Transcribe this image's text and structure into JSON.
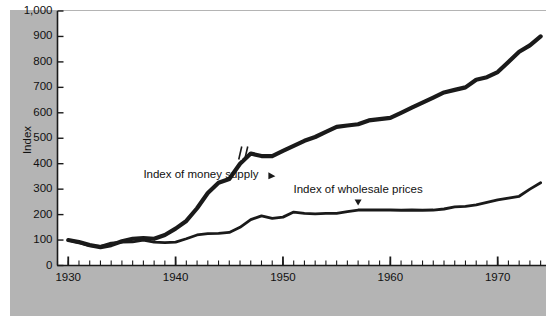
{
  "figure": {
    "background_color": "#ffffff",
    "panel_color": "#b4b4b4",
    "plot_color": "#ffffff",
    "line_color": "#1a1a1a"
  },
  "chart_data": {
    "type": "line",
    "title": "",
    "subtitle": "",
    "xlabel": "",
    "ylabel": "Index",
    "xlim": [
      1929,
      1974.5
    ],
    "ylim": [
      0,
      1000
    ],
    "grid": false,
    "legend_position": "inline-annotation",
    "y_ticks": [
      0,
      100,
      200,
      300,
      400,
      500,
      600,
      700,
      800,
      900,
      1000
    ],
    "y_tick_labels": [
      "0",
      "100",
      "200",
      "300",
      "400",
      "500",
      "600",
      "700",
      "800",
      "900",
      "1,000"
    ],
    "x_ticks": [
      1930,
      1940,
      1950,
      1960,
      1970
    ],
    "x_tick_labels": [
      "1930",
      "1940",
      "1950",
      "1960",
      "1970"
    ],
    "x_minor_tick_interval": 1,
    "annotations": [
      {
        "name": "money-supply-label",
        "text": "Index of money supply",
        "x": 1937.0,
        "y": 355,
        "pointer": "right"
      },
      {
        "name": "wholesale-prices-label",
        "text": "Index of wholesale prices",
        "x": 1957.0,
        "y": 295,
        "pointer": "down"
      },
      {
        "name": "series-break-mark",
        "text": "",
        "x": 1946.3,
        "y": 440,
        "pointer": "break"
      }
    ],
    "series": [
      {
        "name": "Index of money supply",
        "line_width": 4.2,
        "x": [
          1930,
          1931,
          1932,
          1933,
          1934,
          1935,
          1936,
          1937,
          1938,
          1939,
          1940,
          1941,
          1942,
          1943,
          1944,
          1945,
          1946,
          1947,
          1948,
          1949,
          1950,
          1951,
          1952,
          1953,
          1954,
          1955,
          1956,
          1957,
          1958,
          1959,
          1960,
          1961,
          1962,
          1963,
          1964,
          1965,
          1966,
          1967,
          1968,
          1969,
          1970,
          1971,
          1972,
          1973,
          1974
        ],
        "values": [
          100,
          92,
          80,
          72,
          80,
          95,
          105,
          108,
          105,
          120,
          145,
          175,
          225,
          285,
          325,
          340,
          400,
          440,
          430,
          430,
          450,
          470,
          490,
          505,
          525,
          545,
          550,
          555,
          570,
          575,
          580,
          600,
          620,
          640,
          660,
          680,
          690,
          700,
          730,
          740,
          760,
          800,
          840,
          865,
          900
        ]
      },
      {
        "name": "Index of wholesale prices",
        "line_width": 2.8,
        "x": [
          1930,
          1931,
          1932,
          1933,
          1934,
          1935,
          1936,
          1937,
          1938,
          1939,
          1940,
          1941,
          1942,
          1943,
          1944,
          1945,
          1946,
          1947,
          1948,
          1949,
          1950,
          1951,
          1952,
          1953,
          1954,
          1955,
          1956,
          1957,
          1958,
          1959,
          1960,
          1961,
          1962,
          1963,
          1964,
          1965,
          1966,
          1967,
          1968,
          1969,
          1970,
          1971,
          1972,
          1973,
          1974
        ],
        "values": [
          100,
          90,
          78,
          75,
          88,
          92,
          93,
          100,
          92,
          90,
          92,
          105,
          120,
          125,
          126,
          130,
          150,
          180,
          195,
          185,
          190,
          210,
          205,
          203,
          205,
          205,
          212,
          218,
          218,
          218,
          218,
          217,
          218,
          217,
          218,
          222,
          230,
          232,
          238,
          248,
          258,
          265,
          272,
          300,
          325
        ]
      }
    ]
  }
}
